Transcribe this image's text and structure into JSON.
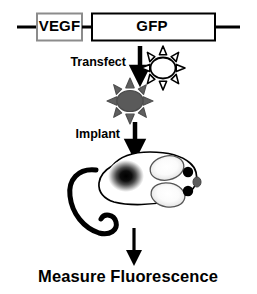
{
  "figure": {
    "background_color": "#ffffff",
    "ink_color": "#000000",
    "width": 257,
    "height": 294
  },
  "construct": {
    "promoter_label": "VEGF",
    "gene_label": "GFP",
    "promoter_box_stroke": "#808080",
    "gene_box_stroke": "#000000",
    "backbone_color": "#000000"
  },
  "steps": [
    {
      "label": "Transfect",
      "arrow": "down-arrow"
    },
    {
      "label": "Implant",
      "arrow": "down-arrow"
    }
  ],
  "cells": [
    {
      "name": "untransfected-cell",
      "fill": "#ffffff",
      "stroke": "#000000",
      "state": "outline"
    },
    {
      "name": "transfected-cell",
      "fill": "#5a5a5a",
      "stroke": "#4a4a4a",
      "state": "filled"
    }
  ],
  "mouse": {
    "body_fill": "#ffffff",
    "body_stroke": "#000000",
    "tumor": {
      "name": "tumor-fluorescence-spot",
      "center_color": "#000000",
      "edge_color": "#ffffff"
    },
    "ears": [
      {
        "name": "mouse-ear-upper",
        "fill": "#f2f2f2"
      },
      {
        "name": "mouse-ear-lower",
        "fill": "#f2f2f2"
      }
    ],
    "eyes": [
      {
        "name": "mouse-eye-upper",
        "fill": "#000000"
      },
      {
        "name": "mouse-eye-lower",
        "fill": "#000000"
      }
    ],
    "nose": {
      "name": "mouse-nose",
      "fill": "#555555"
    },
    "tail": {
      "name": "mouse-tail",
      "stroke": "#000000"
    }
  },
  "caption": {
    "text": "Measure Fluorescence"
  }
}
